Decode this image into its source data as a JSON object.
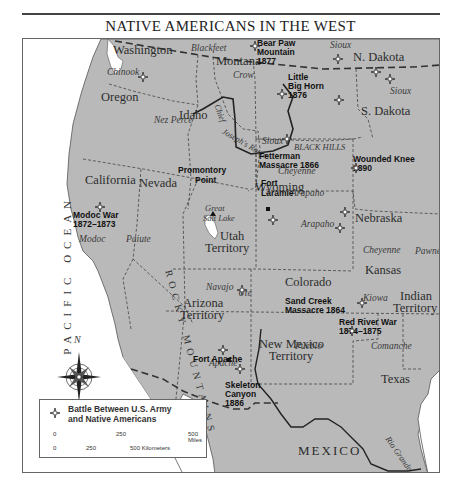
{
  "title": "NATIVE AMERICANS IN THE WEST",
  "ocean_label": "PACIFIC OCEAN",
  "mexico_label": "MEXICO",
  "rocky_mountains_label": "ROCKY MOUNTAINS",
  "states": {
    "washington": "Washington",
    "oregon": "Oregon",
    "idaho": "Idaho",
    "montana": "Montana",
    "wyoming": "Wyoming",
    "n_dakota": "N. Dakota",
    "s_dakota": "S. Dakota",
    "nebraska": "Nebraska",
    "colorado": "Colorado",
    "kansas": "Kansas",
    "nevada": "Nevada",
    "california": "California",
    "utah": "Utah",
    "utah2": "Territory",
    "arizona": "Arizona",
    "arizona2": "Territory",
    "new_mexico": "New Mexico",
    "new_mexico2": "Territory",
    "indian": "Indian",
    "indian2": "Territory",
    "texas": "Texas"
  },
  "tribes": {
    "chinook": "Chinook",
    "blackfeet": "Blackfeet",
    "nez_perce": "Nez Perce",
    "crow": "Crow",
    "sioux_nd": "Sioux",
    "sioux_sd": "Sioux",
    "sioux_wy": "Sioux",
    "cheyenne_wy": "Cheyenne",
    "arapaho_wy": "Arapaho",
    "arapaho_co": "Arapaho",
    "pawnee": "Pawnee",
    "cheyenne_ks": "Cheyenne",
    "modoc": "Modoc",
    "paiute": "Paiute",
    "ute": "Ute",
    "navajo": "Navajo",
    "pueblo": "Pueblo",
    "kiowa": "Kiowa",
    "comanche": "Comanche",
    "apache": "Apache"
  },
  "features": {
    "black_hills": "BLACK HILLS",
    "great_salt_lake_1": "Great",
    "great_salt_lake_2": "Salt Lake",
    "chief_joseph_route_1": "Chief",
    "chief_joseph_route_2": "Joseph's Route",
    "rio_grande": "Rio Grande",
    "promontory_1": "Promontory",
    "promontory_2": "Point",
    "fort_laramie_1": "Fort",
    "fort_laramie_2": "Laramie",
    "fort_apache": "Fort Apache"
  },
  "battles": [
    {
      "name_1": "Bear Paw",
      "name_2": "Mountain",
      "year": "1877"
    },
    {
      "name_1": "Little",
      "name_2": "Big Horn",
      "year": "1876"
    },
    {
      "name_1": "Fetterman",
      "name_2": "Massacre 1866",
      "year": ""
    },
    {
      "name_1": "Wounded Knee",
      "name_2": "1890",
      "year": ""
    },
    {
      "name_1": "Modoc War",
      "name_2": "1872–1873",
      "year": ""
    },
    {
      "name_1": "Sand Creek",
      "name_2": "Massacre 1864",
      "year": ""
    },
    {
      "name_1": "Red River War",
      "name_2": "1874–1875",
      "year": ""
    },
    {
      "name_1": "Skeleton",
      "name_2": "Canyon",
      "year": "1886"
    }
  ],
  "compass": {
    "north_label": "N"
  },
  "legend": {
    "line_1": "Battle Between U.S. Army",
    "line_2": "and Native Americans",
    "miles_0": "0",
    "miles_250": "250",
    "miles_500": "500 Miles",
    "km_0": "0",
    "km_250": "250",
    "km_500": "500 Kilometers"
  },
  "colors": {
    "land": "#b9b9b9",
    "water": "#ffffff",
    "border": "#444444",
    "text": "#2a2a2a"
  }
}
